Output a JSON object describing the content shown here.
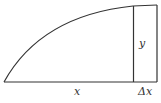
{
  "diagram": {
    "type": "area-under-curve-strip",
    "labels": {
      "y": "y",
      "x": "x",
      "dx": "Δx"
    },
    "colors": {
      "stroke": "#333333",
      "background": "#ffffff"
    }
  }
}
